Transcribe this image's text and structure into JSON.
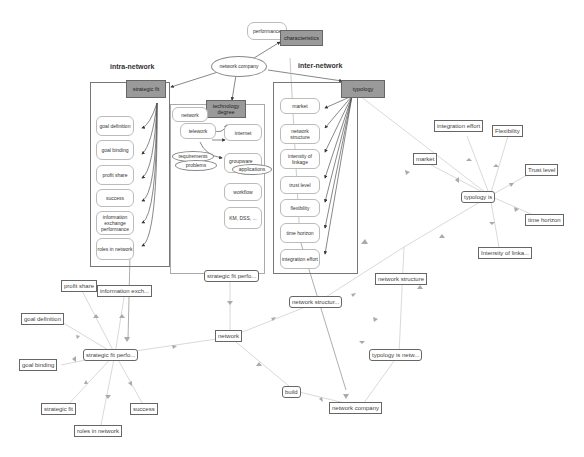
{
  "concept_map": {
    "headings": {
      "intra": "intra-network",
      "inter": "inter-network"
    },
    "top": {
      "performance": "performance",
      "characteristics": "characteristics",
      "network_company": "network company"
    },
    "intra_network": {
      "root": "strategic fit",
      "items": [
        "goal definition",
        "goal binding",
        "profit share",
        "success",
        "information exchange performance",
        "roles in network"
      ]
    },
    "technology": {
      "root": "technology degree",
      "network": "network",
      "telework": "telework",
      "internet": "internet",
      "requirements": "requirements",
      "problems": "problems",
      "groupware": "groupware",
      "applications": "applications",
      "workflow": "workflow",
      "km_dss": "KM, DSS, ..."
    },
    "inter_network": {
      "root": "typology",
      "items": [
        "market",
        "network structure",
        "intensity of linkage",
        "trust level",
        "flexibility",
        "time horizon",
        "integration effort"
      ]
    }
  },
  "graph": {
    "nodes": {
      "typology_is": "typology is",
      "integration_effort": "integration effort",
      "flexibility": "Flexibility",
      "market": "market",
      "trust_level": "Trust level",
      "time_horizon": "time horizon",
      "intensity": "Intensity of linka...",
      "network_structure": "network structure",
      "network_structur_trunc": "network structur...",
      "strategic_fit_perfo_top": "strategic fit perfo...",
      "network": "network",
      "build": "build",
      "network_company": "network company",
      "typology_is_netw": "typology is netw...",
      "strategic_fit_perfo": "strategic fit perfo...",
      "profit_share": "profit share",
      "information_exch": "information exch...",
      "goal_definition": "goal definition",
      "goal_binding": "goal binding",
      "strategic_fit": "strategic fit",
      "success": "success",
      "roles_in_network": "roles in network"
    }
  },
  "colors": {
    "gray_box": "#9a9a9a",
    "edge_light": "#c8c8c8",
    "edge_dark": "#444444",
    "node_border": "#666666"
  }
}
